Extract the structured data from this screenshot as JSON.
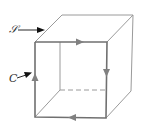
{
  "figure": {
    "labels": {
      "surface": "𝒮",
      "curve": "C"
    },
    "colors": {
      "edge": "#888888",
      "curve": "#6e6e6e",
      "arrow": "#7a7a7a",
      "label": "#333333",
      "pointer": "#111111"
    },
    "curve_orientation": "clockwise as viewed: top left-to-right, right side downward, bottom right-to-left, left side upward"
  }
}
